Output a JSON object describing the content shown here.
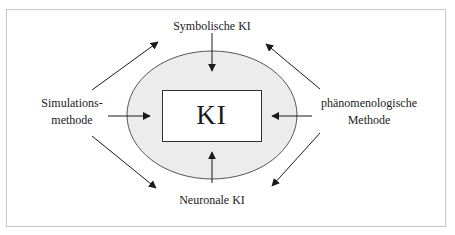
{
  "diagram": {
    "type": "concept-diagram",
    "center": {
      "label": "KI"
    },
    "nodes": {
      "top": {
        "label": "Symbolische KI"
      },
      "bottom": {
        "label": "Neuronale KI"
      },
      "left": {
        "lines": [
          "Simulations-",
          "methode"
        ]
      },
      "right": {
        "lines": [
          "phänomenologische",
          "Methode"
        ]
      }
    },
    "arrows": [
      {
        "from": "Symbolische KI",
        "to": "KI",
        "direction": "down"
      },
      {
        "from": "Neuronale KI",
        "to": "KI",
        "direction": "up"
      },
      {
        "from": "Simulationsmethode",
        "to": "KI",
        "direction": "right"
      },
      {
        "from": "phänomenologische Methode",
        "to": "KI",
        "direction": "left"
      },
      {
        "from": "Simulationsmethode",
        "to": "Symbolische KI",
        "direction": "up-right"
      },
      {
        "from": "Simulationsmethode",
        "to": "Neuronale KI",
        "direction": "down-right"
      },
      {
        "from": "phänomenologische Methode",
        "to": "Symbolische KI",
        "direction": "up-left"
      },
      {
        "from": "phänomenologische Methode",
        "to": "Neuronale KI",
        "direction": "down-left"
      }
    ],
    "colors": {
      "ellipse_fill": "#ececec",
      "ellipse_stroke": "#555555",
      "box_fill": "#ffffff",
      "box_stroke": "#333333",
      "arrow": "#1a1a1a",
      "frame_border": "#c8c8c8"
    }
  }
}
